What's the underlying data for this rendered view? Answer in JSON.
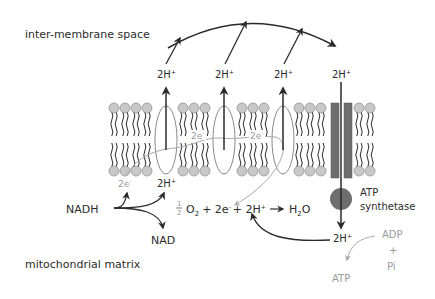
{
  "regions": {
    "top": "inter-membrane space",
    "bottom": "mitochondrial matrix"
  },
  "protons": {
    "pumped": [
      "2H",
      "2H",
      "2H"
    ],
    "synthase_top": "2H",
    "synthase_bottom": "2H",
    "matrix_input": "2H",
    "charge": "+"
  },
  "electrons": {
    "from_nadh": "2e",
    "transfer_1": "2e",
    "transfer_2": "2e",
    "charge": "-"
  },
  "reactants": {
    "nadh": "NADH",
    "nad": "NAD"
  },
  "equation": {
    "half_num": "1",
    "half_den": "2",
    "oxygen": "O",
    "oxygen_sub": "2",
    "plus1": "+ 2e",
    "minus": "-",
    "plus2": "+ 2H",
    "plus_sup": "+",
    "arrow": "→",
    "water_h": "H",
    "water_sub": "2",
    "water_o": "O"
  },
  "atp_synthase": {
    "line1": "ATP",
    "line2": "synthetase"
  },
  "atp_reaction": {
    "adp": "ADP",
    "plus": "+",
    "pi": "Pi",
    "atp": "ATP"
  },
  "colors": {
    "ink": "#2b2b2b",
    "lipid_head": "#c8c8c8",
    "lipid_head_stroke": "#8a8a8a",
    "synthase": "#6e6e6e",
    "grey_path": "#a8a8a8"
  }
}
